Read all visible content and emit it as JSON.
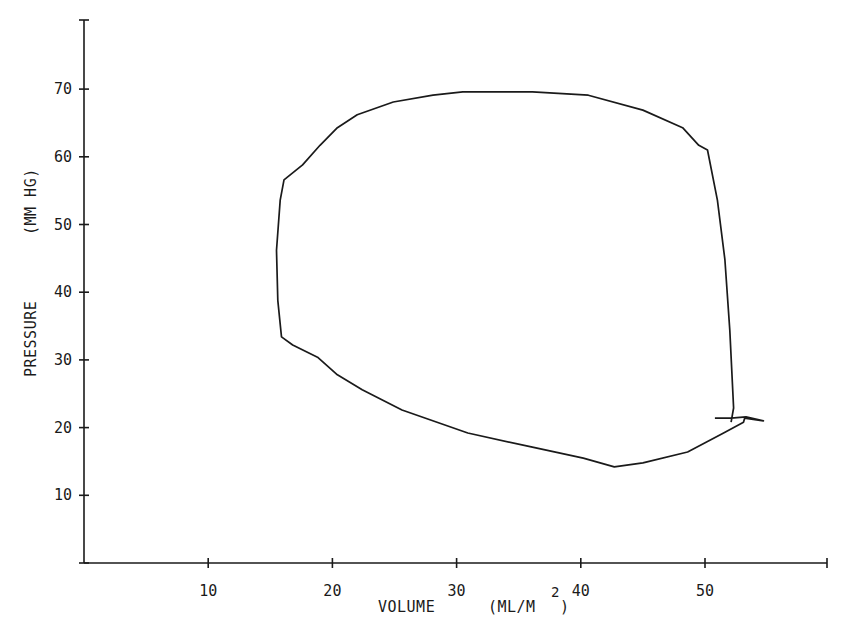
{
  "chart_data": {
    "type": "line",
    "title": "",
    "xlabel": "VOLUME",
    "xlabel_units": "(ML/M",
    "xlabel_units_superscript": "2",
    "xlabel_units_close": ")",
    "ylabel": "PRESSURE",
    "ylabel_units": "(MM HG)",
    "xlim": [
      0,
      60
    ],
    "ylim": [
      0,
      78
    ],
    "x_ticks": [
      10,
      20,
      30,
      40,
      50
    ],
    "x_tick_labels": [
      "10",
      "20",
      "30",
      "40",
      "50"
    ],
    "y_ticks": [
      10,
      20,
      30,
      40,
      50,
      60,
      70
    ],
    "y_tick_labels": [
      "10",
      "20",
      "30",
      "40",
      "50",
      "60",
      "70"
    ],
    "grid": false,
    "legend": null,
    "series": [
      {
        "name": "pressure-volume loop",
        "closed": true,
        "points": [
          [
            52.1,
            20.8
          ],
          [
            52.3,
            22.9
          ],
          [
            52.0,
            34.4
          ],
          [
            51.6,
            44.8
          ],
          [
            51.0,
            53.6
          ],
          [
            50.2,
            61.0
          ],
          [
            49.5,
            61.7
          ],
          [
            48.2,
            64.3
          ],
          [
            45.0,
            66.9
          ],
          [
            40.6,
            69.1
          ],
          [
            36.1,
            69.6
          ],
          [
            30.5,
            69.6
          ],
          [
            28.1,
            69.1
          ],
          [
            24.9,
            68.1
          ],
          [
            22.0,
            66.2
          ],
          [
            20.4,
            64.3
          ],
          [
            19.0,
            61.7
          ],
          [
            17.6,
            58.8
          ],
          [
            16.1,
            56.6
          ],
          [
            15.8,
            53.6
          ],
          [
            15.5,
            46.2
          ],
          [
            15.6,
            38.8
          ],
          [
            15.9,
            33.4
          ],
          [
            16.8,
            32.2
          ],
          [
            18.8,
            30.4
          ],
          [
            20.4,
            27.8
          ],
          [
            22.4,
            25.6
          ],
          [
            25.6,
            22.6
          ],
          [
            30.9,
            19.2
          ],
          [
            36.1,
            17.1
          ],
          [
            40.2,
            15.5
          ],
          [
            42.7,
            14.2
          ],
          [
            45.0,
            14.8
          ],
          [
            48.6,
            16.4
          ],
          [
            51.5,
            19.2
          ],
          [
            53.1,
            20.8
          ],
          [
            53.2,
            21.4
          ],
          [
            54.7,
            21.0
          ],
          [
            53.3,
            21.6
          ],
          [
            52.1,
            21.4
          ],
          [
            50.8,
            21.4
          ]
        ]
      }
    ]
  }
}
